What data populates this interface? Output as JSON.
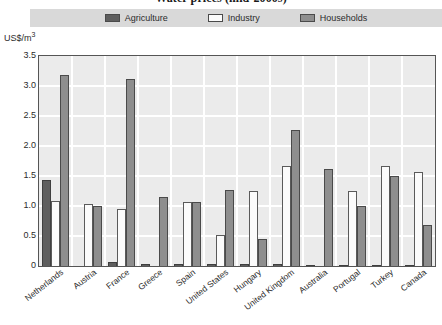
{
  "chart_data": {
    "type": "bar",
    "title": "Water prices (mid-2000s)",
    "xlabel": "",
    "ylabel": "US$/m3",
    "ylim": [
      0,
      3.5
    ],
    "yticks": [
      "0",
      "0.5",
      "1.0",
      "1.5",
      "2.0",
      "2.5",
      "3.0",
      "3.5"
    ],
    "ytick_values": [
      0,
      0.5,
      1.0,
      1.5,
      2.0,
      2.5,
      3.0,
      3.5
    ],
    "grid": true,
    "legend_position": "top",
    "categories": [
      "Netherlands",
      "Austria",
      "France",
      "Greece",
      "Spain",
      "United States",
      "Hungary",
      "United Kingdom",
      "Australia",
      "Portugal",
      "Turkey",
      "Canada"
    ],
    "series": [
      {
        "name": "Agriculture",
        "color": "#5e5e5e",
        "values": [
          1.43,
          0.0,
          0.07,
          0.03,
          0.03,
          0.03,
          0.03,
          0.03,
          0.02,
          0.02,
          0.02,
          0.02
        ]
      },
      {
        "name": "Industry",
        "color": "#fbfbfb",
        "values": [
          1.08,
          1.04,
          0.95,
          0.0,
          1.07,
          0.52,
          1.25,
          1.67,
          0.0,
          1.25,
          1.67,
          1.57
        ]
      },
      {
        "name": "Households",
        "color": "#8e8e8e",
        "values": [
          3.19,
          1.0,
          3.11,
          1.15,
          1.07,
          1.27,
          0.45,
          2.26,
          1.61,
          1.0,
          1.5,
          0.69
        ]
      }
    ]
  },
  "legend": {
    "items": [
      {
        "label": "Agriculture",
        "color": "#5e5e5e"
      },
      {
        "label": "Industry",
        "color": "#fbfbfb"
      },
      {
        "label": "Households",
        "color": "#8e8e8e"
      }
    ]
  },
  "axis": {
    "unit_label_main": "US$/m",
    "unit_label_sup": "3"
  },
  "colors": {
    "plot_background": "#ebebeb",
    "gridline": "#ffffff",
    "legend_band": "#d9d9d9",
    "frame": "#555555"
  }
}
